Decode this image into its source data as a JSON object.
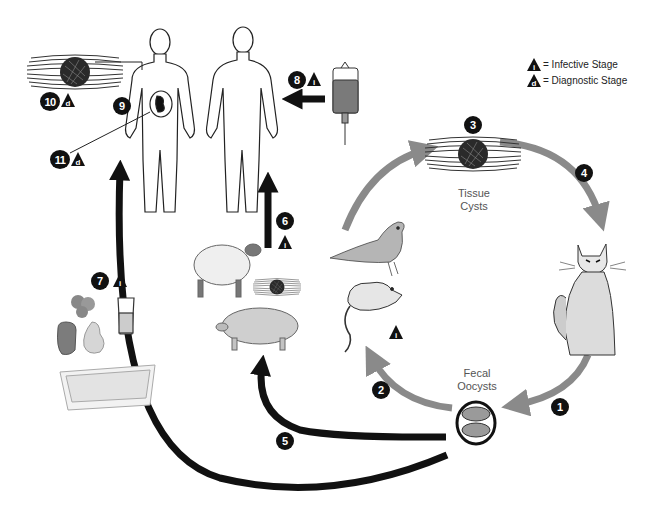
{
  "diagram": {
    "legend": {
      "infective": {
        "symbol": "i",
        "label": "= Infective Stage"
      },
      "diagnostic": {
        "symbol": "d",
        "label": "= Diagnostic Stage"
      }
    },
    "labels": {
      "tissue_cysts_line1": "Tissue",
      "tissue_cysts_line2": "Cysts",
      "fecal_oocysts_line1": "Fecal",
      "fecal_oocysts_line2": "Oocysts"
    },
    "steps": [
      {
        "n": "1",
        "desc": "Cat feces oocysts shed"
      },
      {
        "n": "2",
        "desc": "Intermediate hosts (rodents, birds) infected"
      },
      {
        "n": "3",
        "desc": "Tissue cysts form"
      },
      {
        "n": "4",
        "desc": "Cats ingest tissue cysts"
      },
      {
        "n": "5",
        "desc": "Livestock infected from oocysts"
      },
      {
        "n": "6",
        "desc": "Humans infected eating undercooked meat",
        "stage": "i"
      },
      {
        "n": "7",
        "desc": "Contaminated food/water/litter",
        "stage": "i"
      },
      {
        "n": "8",
        "desc": "Blood transfusion / organ transplant",
        "stage": "i"
      },
      {
        "n": "9",
        "desc": "Transplacental transmission"
      },
      {
        "n": "10",
        "desc": "Tissue cysts in human",
        "stage": "d"
      },
      {
        "n": "11",
        "desc": "Congenital infection",
        "stage": "d"
      }
    ],
    "colors": {
      "cycle_arrow": "#8a8a8a",
      "human_arrow": "#111111",
      "badge": "#111111"
    }
  }
}
